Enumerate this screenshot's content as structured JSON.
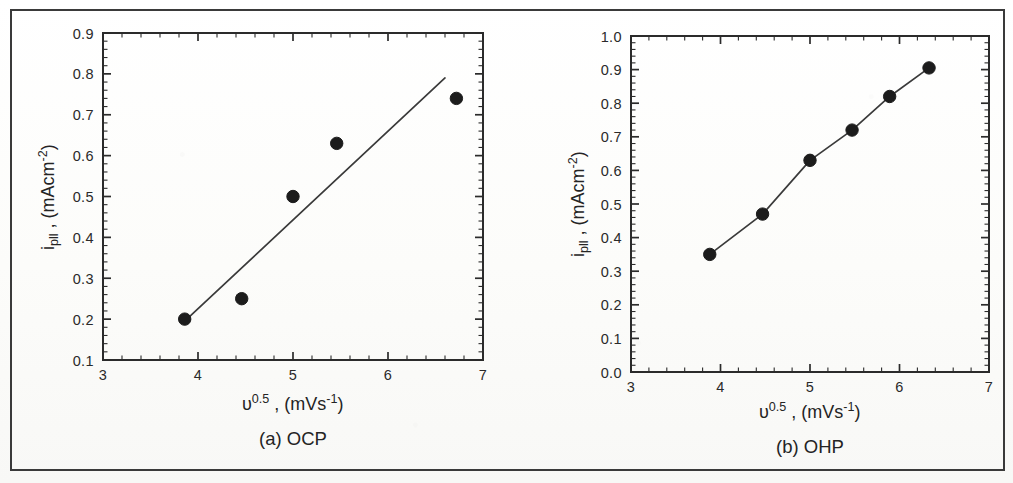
{
  "figure": {
    "background_color": "#fdfdfb",
    "border_color": "#3a3a3a",
    "axis_color": "#2b2b2b",
    "marker_color": "#1c1c1c",
    "line_color": "#3a3a3a"
  },
  "panels": [
    {
      "id": "a",
      "caption": "(a) OCP",
      "ylabel_main": "i",
      "ylabel_sub": "pll",
      "ylabel_rest": " , (mAcm",
      "ylabel_sup": "-2",
      "ylabel_close": ")",
      "xlabel_main": "υ",
      "xlabel_sup": "0.5",
      "xlabel_rest": " , (mVs",
      "xlabel_sup2": "-1",
      "xlabel_close": ")",
      "ytick_labels": [
        "0.9",
        "0.8",
        "0.7",
        "0.6",
        "0.5",
        "0.4",
        "0.3",
        "0.2",
        "0.1"
      ],
      "xtick_labels": [
        "3",
        "4",
        "5",
        "6",
        "7"
      ]
    },
    {
      "id": "b",
      "caption": "(b) OHP",
      "ylabel_main": "i",
      "ylabel_sub": "pll",
      "ylabel_rest": " , (mAcm",
      "ylabel_sup": "-2",
      "ylabel_close": ")",
      "xlabel_main": "υ",
      "xlabel_sup": "0.5",
      "xlabel_rest": " , (mVs",
      "xlabel_sup2": "-1",
      "xlabel_close": ")",
      "ytick_labels": [
        "1.0",
        "0.9",
        "0.8",
        "0.7",
        "0.6",
        "0.5",
        "0.4",
        "0.3",
        "0.2",
        "0.1",
        "0.0"
      ],
      "xtick_labels": [
        "3",
        "4",
        "5",
        "6",
        "7"
      ]
    }
  ],
  "chart_data": [
    {
      "type": "scatter",
      "title": "(a) OCP",
      "xlabel": "υ^0.5 , (mVs^-1)",
      "ylabel": "i_pll , (mAcm^-2)",
      "xlim": [
        3,
        7
      ],
      "ylim": [
        0.1,
        0.9
      ],
      "xticks": [
        3,
        4,
        5,
        6,
        7
      ],
      "yticks": [
        0.1,
        0.2,
        0.3,
        0.4,
        0.5,
        0.6,
        0.7,
        0.8,
        0.9
      ],
      "minor_ticks_per_interval": 4,
      "grid": false,
      "legend": false,
      "series": [
        {
          "name": "OCP data points",
          "marker": "filled-circle",
          "x": [
            3.86,
            4.46,
            5.0,
            5.46,
            6.72
          ],
          "y": [
            0.2,
            0.25,
            0.5,
            0.63,
            0.74
          ]
        },
        {
          "name": "linear fit",
          "marker": "none",
          "line": true,
          "x": [
            3.86,
            6.6
          ],
          "y": [
            0.195,
            0.79
          ]
        }
      ]
    },
    {
      "type": "line",
      "title": "(b) OHP",
      "xlabel": "υ^0.5 , (mVs^-1)",
      "ylabel": "i_pll , (mAcm^-2)",
      "xlim": [
        3,
        7
      ],
      "ylim": [
        0.0,
        1.0
      ],
      "xticks": [
        3,
        4,
        5,
        6,
        7
      ],
      "yticks": [
        0.0,
        0.1,
        0.2,
        0.3,
        0.4,
        0.5,
        0.6,
        0.7,
        0.8,
        0.9,
        1.0
      ],
      "minor_ticks_per_interval": 4,
      "grid": false,
      "legend": false,
      "series": [
        {
          "name": "OHP data points",
          "marker": "filled-circle",
          "line": true,
          "x": [
            3.88,
            4.47,
            5.0,
            5.47,
            5.89,
            6.33
          ],
          "y": [
            0.35,
            0.47,
            0.63,
            0.72,
            0.82,
            0.905
          ]
        }
      ]
    }
  ]
}
